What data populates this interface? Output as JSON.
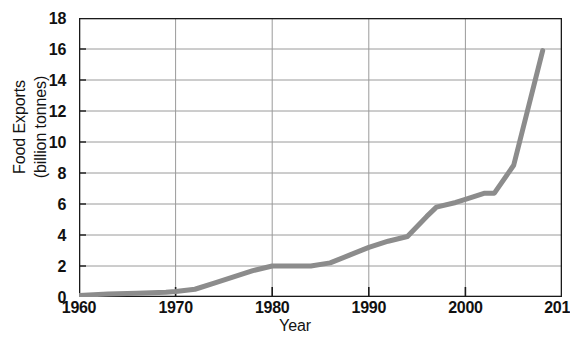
{
  "chart_data": {
    "type": "line",
    "title": "",
    "xlabel": "Year",
    "ylabel": "Food Exports (billion tonnes)",
    "ylabel_lines": [
      "Food Exports",
      "(billion tonnes)"
    ],
    "xlim": [
      1960,
      2010
    ],
    "ylim": [
      0,
      18
    ],
    "grid": true,
    "legend": "none",
    "series_color": "#8c8c8c",
    "axis_color": "#1a1a1a",
    "grid_color": "#9a9a9a",
    "xticks": [
      1960,
      1970,
      1980,
      1990,
      2000,
      2010
    ],
    "xtick_labels": [
      "1960",
      "1970",
      "1980",
      "1990",
      "2000",
      "201"
    ],
    "yticks": [
      0,
      2,
      4,
      6,
      8,
      10,
      12,
      14,
      16,
      18
    ],
    "ytick_labels": [
      "0",
      "2",
      "4",
      "6",
      "8",
      "10",
      "12",
      "14",
      "16",
      "18"
    ],
    "series": [
      {
        "name": "Food Exports",
        "x": [
          1960,
          1963,
          1966,
          1969,
          1970,
          1972,
          1974,
          1976,
          1978,
          1980,
          1982,
          1984,
          1986,
          1988,
          1990,
          1992,
          1994,
          1996,
          1997,
          1999,
          2000,
          2002,
          2003,
          2005,
          2008
        ],
        "values": [
          0.1,
          0.2,
          0.25,
          0.3,
          0.35,
          0.5,
          0.9,
          1.3,
          1.7,
          2.0,
          2.0,
          2.0,
          2.2,
          2.7,
          3.2,
          3.6,
          3.9,
          5.2,
          5.8,
          6.1,
          6.3,
          6.7,
          6.7,
          8.5,
          15.9
        ]
      }
    ]
  }
}
